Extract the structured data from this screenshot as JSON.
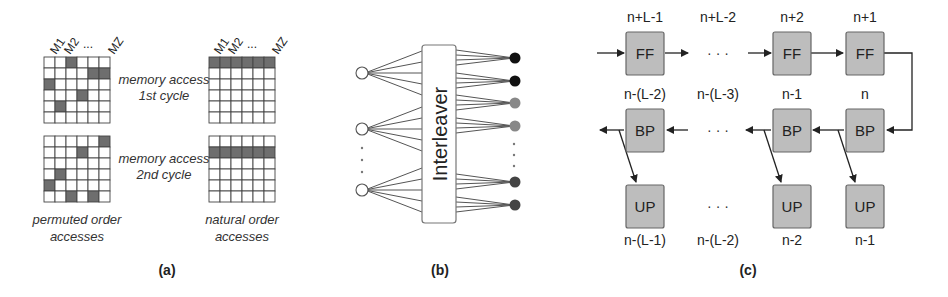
{
  "panel_a": {
    "caption": "(a)",
    "column_headers": [
      "M1",
      "M2",
      "...",
      "MZ"
    ],
    "grids": [
      {
        "id": "permuted-1st",
        "shaded": [
          [
            0,
            2
          ],
          [
            1,
            4
          ],
          [
            1,
            5
          ],
          [
            2,
            0
          ],
          [
            3,
            3
          ],
          [
            4,
            1
          ]
        ]
      },
      {
        "id": "natural-1st",
        "shaded_row": 0
      },
      {
        "id": "permuted-2nd",
        "shaded": [
          [
            0,
            5
          ],
          [
            1,
            3
          ],
          [
            3,
            1
          ],
          [
            4,
            0
          ],
          [
            5,
            2
          ],
          [
            5,
            4
          ]
        ]
      },
      {
        "id": "natural-2nd",
        "shaded_row": 1
      }
    ],
    "label_1st": [
      "memory access",
      "1st cycle"
    ],
    "label_2nd": [
      "memory access",
      "2nd cycle"
    ],
    "label_permuted": [
      "permuted order",
      "accesses"
    ],
    "label_natural": [
      "natural order",
      "accesses"
    ]
  },
  "panel_b": {
    "caption": "(b)",
    "interleaver_label": "Interleaver",
    "left_nodes": 3,
    "right_nodes": 6,
    "right_node_colors": [
      "#111111",
      "#111111",
      "#888888",
      "#888888",
      "#444444",
      "#444444"
    ]
  },
  "panel_c": {
    "caption": "(c)",
    "ff_row": {
      "labels": [
        "n+L-1",
        "n+L-2",
        "n+2",
        "n+1"
      ],
      "box": "FF"
    },
    "bp_row": {
      "labels": [
        "n-(L-2)",
        "n-(L-3)",
        "n-1",
        "n"
      ],
      "box": "BP"
    },
    "up_row": {
      "labels": [
        "n-(L-1)",
        "n-(L-2)",
        "n-2",
        "n-1"
      ],
      "box": "UP"
    },
    "ellipsis": "· · ·"
  }
}
